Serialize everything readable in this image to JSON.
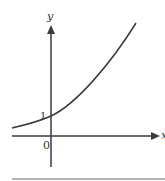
{
  "diagram": {
    "type": "function-graph",
    "axes": {
      "x_label": "x",
      "y_label": "y",
      "origin_label": "0"
    },
    "annotations": {
      "y_intercept_label": "1"
    },
    "curve": "increasing convex curve, approaching 0 on left, passing through (0,1)",
    "colors": {
      "stroke": "#3a3a3a",
      "rule": "#9a9a9a"
    }
  }
}
